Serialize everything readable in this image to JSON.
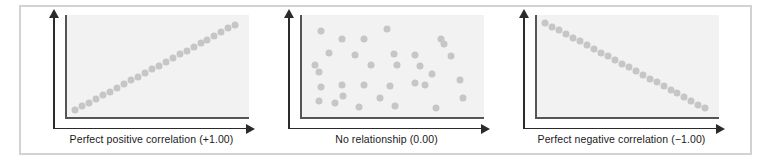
{
  "figure": {
    "panel_count": 3,
    "frame_color": "#d2d2d2",
    "plot_background": "#f2f2f2",
    "dot_color": "#c6c6c6",
    "axis_color": "#2b2b2b",
    "plot_border_color": "#555555"
  },
  "panels": [
    {
      "id": "perfect-positive",
      "caption": "Perfect positive correlation (+1.00)",
      "correlation": 1.0
    },
    {
      "id": "no-relationship",
      "caption": "No relationship (0.00)",
      "correlation": 0.0
    },
    {
      "id": "perfect-negative",
      "caption": "Perfect negative correlation (−1.00)",
      "correlation": -1.0
    }
  ],
  "chart_data": [
    {
      "type": "scatter",
      "title": "Perfect positive correlation (+1.00)",
      "xlabel": "",
      "ylabel": "",
      "xlim": [
        0,
        100
      ],
      "ylim": [
        0,
        100
      ],
      "grid": false,
      "legend": "none",
      "correlation": 1.0,
      "points": [
        [
          3,
          3
        ],
        [
          7,
          7
        ],
        [
          11,
          11
        ],
        [
          15,
          15
        ],
        [
          19,
          19
        ],
        [
          23,
          23
        ],
        [
          27,
          27
        ],
        [
          31,
          31
        ],
        [
          35,
          35
        ],
        [
          39,
          39
        ],
        [
          43,
          43
        ],
        [
          47,
          47
        ],
        [
          51,
          51
        ],
        [
          55,
          55
        ],
        [
          59,
          59
        ],
        [
          63,
          63
        ],
        [
          67,
          67
        ],
        [
          71,
          71
        ],
        [
          75,
          75
        ],
        [
          79,
          79
        ],
        [
          83,
          83
        ],
        [
          87,
          87
        ],
        [
          91,
          91
        ],
        [
          95,
          95
        ]
      ]
    },
    {
      "type": "scatter",
      "title": "No relationship (0.00)",
      "xlabel": "",
      "ylabel": "",
      "xlim": [
        0,
        100
      ],
      "ylim": [
        0,
        100
      ],
      "grid": false,
      "legend": "none",
      "correlation": 0.0,
      "points": [
        [
          9,
          88
        ],
        [
          21,
          80
        ],
        [
          34,
          80
        ],
        [
          47,
          90
        ],
        [
          14,
          65
        ],
        [
          6,
          52
        ],
        [
          8,
          44
        ],
        [
          29,
          62
        ],
        [
          51,
          63
        ],
        [
          63,
          62
        ],
        [
          53,
          52
        ],
        [
          38,
          52
        ],
        [
          9,
          28
        ],
        [
          21,
          30
        ],
        [
          34,
          30
        ],
        [
          49,
          29
        ],
        [
          22,
          18
        ],
        [
          8,
          13
        ],
        [
          17,
          11
        ],
        [
          31,
          6
        ],
        [
          43,
          16
        ],
        [
          52,
          8
        ],
        [
          66,
          51
        ],
        [
          73,
          42
        ],
        [
          78,
          80
        ],
        [
          80,
          74
        ],
        [
          84,
          61
        ],
        [
          89,
          35
        ],
        [
          91,
          16
        ],
        [
          69,
          30
        ],
        [
          75,
          5
        ],
        [
          63,
          32
        ]
      ]
    },
    {
      "type": "scatter",
      "title": "Perfect negative correlation (−1.00)",
      "xlabel": "",
      "ylabel": "",
      "xlim": [
        0,
        100
      ],
      "ylim": [
        0,
        100
      ],
      "grid": false,
      "legend": "none",
      "correlation": -1.0,
      "points": [
        [
          3,
          97
        ],
        [
          7,
          93
        ],
        [
          11,
          89
        ],
        [
          15,
          85
        ],
        [
          19,
          81
        ],
        [
          23,
          77
        ],
        [
          27,
          73
        ],
        [
          31,
          69
        ],
        [
          35,
          65
        ],
        [
          39,
          61
        ],
        [
          43,
          57
        ],
        [
          47,
          53
        ],
        [
          51,
          49
        ],
        [
          55,
          45
        ],
        [
          59,
          41
        ],
        [
          63,
          37
        ],
        [
          67,
          33
        ],
        [
          71,
          29
        ],
        [
          75,
          25
        ],
        [
          79,
          21
        ],
        [
          83,
          17
        ],
        [
          87,
          13
        ],
        [
          91,
          9
        ],
        [
          95,
          5
        ]
      ]
    }
  ]
}
